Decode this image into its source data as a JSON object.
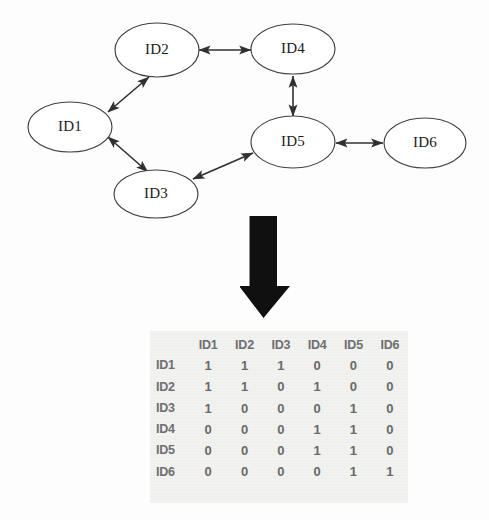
{
  "graph": {
    "nodes": [
      {
        "id": "ID1",
        "label": "ID1",
        "cx": 70,
        "cy": 127,
        "rx": 42,
        "ry": 25
      },
      {
        "id": "ID2",
        "label": "ID2",
        "cx": 157,
        "cy": 50,
        "rx": 42,
        "ry": 27
      },
      {
        "id": "ID3",
        "label": "ID3",
        "cx": 156,
        "cy": 194,
        "rx": 42,
        "ry": 24
      },
      {
        "id": "ID4",
        "label": "ID4",
        "cx": 293,
        "cy": 49,
        "rx": 42,
        "ry": 25
      },
      {
        "id": "ID5",
        "label": "ID5",
        "cx": 293,
        "cy": 142,
        "rx": 42,
        "ry": 26
      },
      {
        "id": "ID6",
        "label": "ID6",
        "cx": 425,
        "cy": 143,
        "rx": 41,
        "ry": 25
      }
    ],
    "edges": [
      {
        "from": "ID1",
        "to": "ID2",
        "style": "double-arrow"
      },
      {
        "from": "ID1",
        "to": "ID3",
        "style": "double-arrow"
      },
      {
        "from": "ID2",
        "to": "ID4",
        "style": "double-arrow"
      },
      {
        "from": "ID3",
        "to": "ID5",
        "style": "double-arrow"
      },
      {
        "from": "ID4",
        "to": "ID5",
        "style": "double-arrow"
      },
      {
        "from": "ID5",
        "to": "ID6",
        "style": "double-arrow"
      }
    ]
  },
  "transform": {
    "icon": "down-arrow-icon",
    "color": "#101010"
  },
  "matrix": {
    "corner": "",
    "columns": [
      "ID1",
      "ID2",
      "ID3",
      "ID4",
      "ID5",
      "ID6"
    ],
    "rows": [
      {
        "header": "ID1",
        "values": [
          "1",
          "1",
          "1",
          "0",
          "0",
          "0"
        ]
      },
      {
        "header": "ID2",
        "values": [
          "1",
          "1",
          "0",
          "1",
          "0",
          "0"
        ]
      },
      {
        "header": "ID3",
        "values": [
          "1",
          "0",
          "0",
          "0",
          "1",
          "0"
        ]
      },
      {
        "header": "ID4",
        "values": [
          "0",
          "0",
          "0",
          "1",
          "1",
          "0"
        ]
      },
      {
        "header": "ID5",
        "values": [
          "0",
          "0",
          "0",
          "1",
          "1",
          "0"
        ]
      },
      {
        "header": "ID6",
        "values": [
          "0",
          "0",
          "0",
          "0",
          "1",
          "1"
        ]
      }
    ]
  },
  "colors": {
    "node_stroke": "#404040",
    "node_fill": "#ffffff",
    "edge": "#303030",
    "matrix_background": "#f2f2f1",
    "matrix_text": "#6a6a6a",
    "arrow": "#101010"
  }
}
